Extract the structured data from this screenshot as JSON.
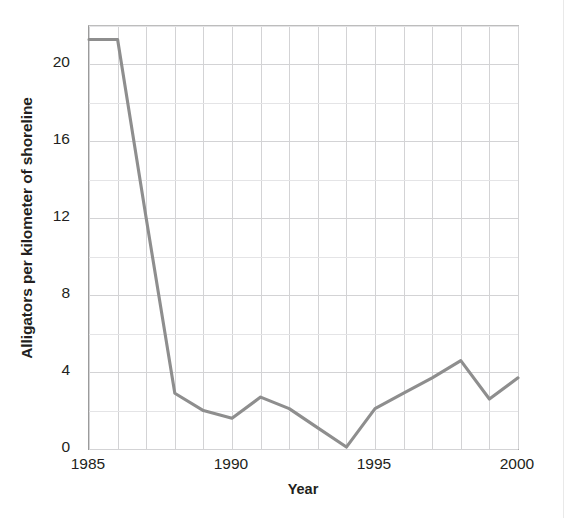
{
  "chart_data": {
    "type": "line",
    "title": "",
    "xlabel": "Year",
    "ylabel": "Alligators per kilometer of shoreline",
    "xlim": [
      1985,
      2000
    ],
    "ylim": [
      0,
      22
    ],
    "grid": true,
    "legend": "none",
    "line_color": "#8e8e8e",
    "x": [
      1985,
      1986,
      1987,
      1988,
      1989,
      1990,
      1991,
      1992,
      1993,
      1994,
      1995,
      1996,
      1997,
      1998,
      1999,
      2000
    ],
    "values": [
      21.3,
      21.3,
      12.0,
      2.9,
      2.0,
      1.6,
      2.7,
      2.1,
      1.1,
      0.1,
      2.1,
      2.9,
      3.7,
      4.6,
      2.6,
      3.7
    ],
    "series": [
      {
        "name": "Alligators per kilometer of shoreline",
        "values": [
          21.3,
          21.3,
          12.0,
          2.9,
          2.0,
          1.6,
          2.7,
          2.1,
          1.1,
          0.1,
          2.1,
          2.9,
          3.7,
          4.6,
          2.6,
          3.7
        ]
      }
    ],
    "y_ticks": [
      0,
      4,
      8,
      12,
      16,
      20
    ],
    "y_tick_labels": [
      "0",
      "4",
      "8",
      "12",
      "16",
      "20"
    ],
    "y_minor_step": 2,
    "x_ticks": [
      1985,
      1990,
      1995,
      2000
    ],
    "x_tick_labels": [
      "1985",
      "1990",
      "1995",
      "2000"
    ],
    "x_gridline_step": 1,
    "annotations": []
  },
  "axis": {
    "y_title": "Alligators per kilometer of shoreline",
    "x_title": "Year"
  }
}
